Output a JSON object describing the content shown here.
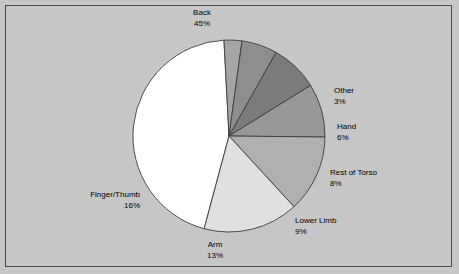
{
  "chart_data": {
    "type": "pie",
    "title": "",
    "categories": [
      "Back",
      "Other",
      "Hand",
      "Rest of Torso",
      "Lower Limb",
      "Arm",
      "Finger/Thumb"
    ],
    "values": [
      45,
      3,
      6,
      8,
      9,
      13,
      16
    ],
    "value_suffix": "%",
    "legend": "none",
    "labels_position": "outside",
    "slices": [
      {
        "name": "Back",
        "value": 45,
        "value_text": "45%",
        "color": "#ffffff"
      },
      {
        "name": "Other",
        "value": 3,
        "value_text": "3%",
        "color": "#a5a5a5"
      },
      {
        "name": "Hand",
        "value": 6,
        "value_text": "6%",
        "color": "#8e8e8e"
      },
      {
        "name": "Rest of Torso",
        "value": 8,
        "value_text": "8%",
        "color": "#7b7b7b"
      },
      {
        "name": "Lower Limb",
        "value": 9,
        "value_text": "9%",
        "color": "#989898"
      },
      {
        "name": "Arm",
        "value": 13,
        "value_text": "13%",
        "color": "#b0b0b0"
      },
      {
        "name": "Finger/Thumb",
        "value": 16,
        "value_text": "16%",
        "color": "#e0e0e0"
      }
    ],
    "geometry": {
      "center_x": 229,
      "center_y": 136,
      "radius": 96,
      "start_angle_deg": 195,
      "direction": "clockwise"
    },
    "style": {
      "background": "#c6c6c6",
      "frame_border": "#4a4a4a",
      "slice_outline": "#3d3d3d",
      "label_color": "#000000"
    }
  },
  "labels": {
    "back": {
      "name": "Back",
      "value": "45%"
    },
    "other": {
      "name": "Other",
      "value": "3%"
    },
    "hand": {
      "name": "Hand",
      "value": "6%"
    },
    "rest_of_torso": {
      "name": "Rest of Torso",
      "value": "8%"
    },
    "lower_limb": {
      "name": "Lower Limb",
      "value": "9%"
    },
    "arm": {
      "name": "Arm",
      "value": "13%"
    },
    "finger_thumb": {
      "name": "Finger/Thumb",
      "value": "16%"
    }
  }
}
